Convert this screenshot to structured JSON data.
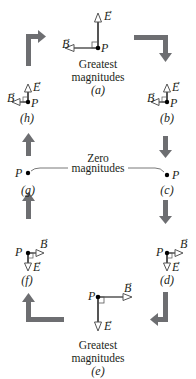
{
  "diagram": {
    "colors": {
      "field_line": "#555555",
      "cycle_arrow": "#6d6e71",
      "text": "#231f20",
      "point": "#000000"
    },
    "vector_labels": {
      "E": "E",
      "B": "B",
      "arrow_mark": "→",
      "point": "P"
    },
    "states": [
      {
        "id": "a",
        "label": "(a)",
        "caption_line1": "Greatest",
        "caption_line2": "magnitudes",
        "E": "up",
        "B": "left",
        "magnitude": "greatest"
      },
      {
        "id": "b",
        "label": "(b)",
        "E": "up",
        "B": "left",
        "magnitude": "small"
      },
      {
        "id": "c",
        "label": "(c)",
        "E": "none",
        "B": "none",
        "magnitude": "zero"
      },
      {
        "id": "d",
        "label": "(d)",
        "E": "down",
        "B": "right",
        "magnitude": "small"
      },
      {
        "id": "e",
        "label": "(e)",
        "caption_line1": "Greatest",
        "caption_line2": "magnitudes",
        "E": "down",
        "B": "right",
        "magnitude": "greatest"
      },
      {
        "id": "f",
        "label": "(f)",
        "E": "down",
        "B": "right",
        "magnitude": "small"
      },
      {
        "id": "g",
        "label": "(g)",
        "E": "none",
        "B": "none",
        "magnitude": "zero"
      },
      {
        "id": "h",
        "label": "(h)",
        "E": "up",
        "B": "left",
        "magnitude": "small"
      }
    ],
    "zero_caption": {
      "line1": "Zero",
      "line2": "magnitudes"
    },
    "cycle_direction": "clockwise"
  }
}
